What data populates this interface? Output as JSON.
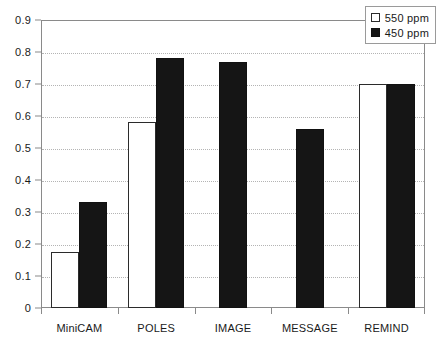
{
  "chart_data": {
    "type": "bar",
    "title": "",
    "xlabel": "",
    "ylabel": "",
    "categories": [
      "MiniCAM",
      "POLES",
      "IMAGE",
      "MESSAGE",
      "REMIND"
    ],
    "series": [
      {
        "name": "550 ppm",
        "color": "#ffffff",
        "values": [
          0.175,
          0.58,
          null,
          null,
          0.7
        ]
      },
      {
        "name": "450 ppm",
        "color": "#151515",
        "values": [
          0.33,
          0.78,
          0.77,
          0.56,
          0.7
        ]
      }
    ],
    "ylim": [
      0,
      0.9
    ],
    "ytick_labels": [
      "0.9",
      "0.8",
      "0.7",
      "0.6",
      "0.5",
      "0.4",
      "0.3",
      "0.2",
      "0.1",
      "0"
    ],
    "ytick_values": [
      0.9,
      0.8,
      0.7,
      0.6,
      0.5,
      0.4,
      0.3,
      0.2,
      0.1,
      0
    ],
    "grid": true,
    "legend_position": "top-right"
  },
  "legend": {
    "items": [
      {
        "label": "550 ppm",
        "swatch": "open-square-swatch"
      },
      {
        "label": "450 ppm",
        "swatch": "filled-square-swatch"
      }
    ]
  }
}
